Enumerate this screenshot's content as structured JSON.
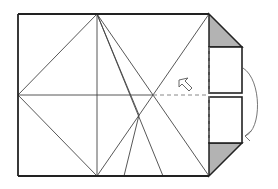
{
  "diagram": {
    "type": "origami-fold-step",
    "colors": {
      "background": "#ffffff",
      "line": "#333333",
      "outline": "#222222",
      "shade": "#b3b3b3",
      "dashed": "#777777",
      "arrow": "#666666"
    },
    "outline": {
      "x1": 18,
      "y1": 14,
      "x2": 209,
      "y2": 176
    },
    "crease_lines": [
      {
        "x1": 97,
        "y1": 14,
        "x2": 97,
        "y2": 176
      },
      {
        "x1": 18,
        "y1": 95,
        "x2": 153,
        "y2": 95
      },
      {
        "x1": 97,
        "y1": 14,
        "x2": 18,
        "y2": 95
      },
      {
        "x1": 18,
        "y1": 95,
        "x2": 97,
        "y2": 176
      },
      {
        "x1": 97,
        "y1": 14,
        "x2": 209,
        "y2": 176
      },
      {
        "x1": 209,
        "y1": 14,
        "x2": 97,
        "y2": 176
      },
      {
        "x1": 97,
        "y1": 14,
        "x2": 139,
        "y2": 115
      },
      {
        "x1": 139,
        "y1": 115,
        "x2": 124,
        "y2": 176
      },
      {
        "x1": 97,
        "y1": 14,
        "x2": 163,
        "y2": 176
      }
    ],
    "dashed_lines": [
      {
        "x1": 153,
        "y1": 95,
        "x2": 209,
        "y2": 95
      },
      {
        "x1": 209,
        "y1": 47,
        "x2": 209,
        "y2": 143
      }
    ],
    "tabs": [
      {
        "name": "top-tab",
        "x": 209,
        "y": 47,
        "w": 33,
        "h": 46
      },
      {
        "name": "bottom-tab",
        "x": 209,
        "y": 97,
        "w": 33,
        "h": 46
      }
    ],
    "shaded_triangles": [
      {
        "name": "top-corner",
        "points": "209,14 242,47 209,47"
      },
      {
        "name": "bottom-corner",
        "points": "209,143 242,143 209,176"
      }
    ],
    "arrows": [
      {
        "name": "hollow-push-arrow",
        "direction": "up-left",
        "x": 184,
        "y": 86
      },
      {
        "name": "curved-fold-arrow",
        "direction": "down-around",
        "from": [
          243,
          68
        ],
        "to": [
          243,
          136
        ]
      }
    ]
  }
}
